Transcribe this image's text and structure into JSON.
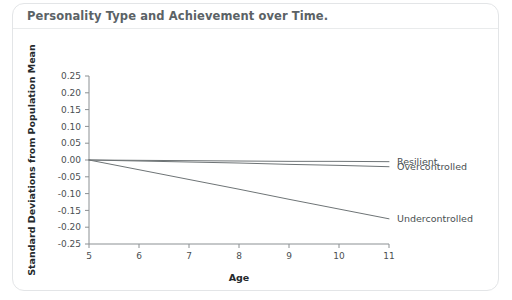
{
  "card": {
    "title": "Personality Type and Achievement over Time."
  },
  "chart_data": {
    "type": "line",
    "title": "Personality Type and Achievement over Time.",
    "xlabel": "Age",
    "ylabel": "Standard Deviations from Population Mean",
    "x": [
      5,
      6,
      7,
      8,
      9,
      10,
      11
    ],
    "xlim": [
      5,
      11
    ],
    "ylim": [
      -0.25,
      0.25
    ],
    "xticks": [
      "5",
      "6",
      "7",
      "8",
      "9",
      "10",
      "11"
    ],
    "yticks": [
      "0.25",
      "0.20",
      "0.15",
      "0.10",
      "0.05",
      "0.00",
      "-0.05",
      "-0.10",
      "-0.15",
      "-0.20",
      "-0.25"
    ],
    "ytick_values": [
      0.25,
      0.2,
      0.15,
      0.1,
      0.05,
      0,
      -0.05,
      -0.1,
      -0.15,
      -0.2,
      -0.25
    ],
    "grid": false,
    "legend_position": "right-inline",
    "line_color": "#6e7476",
    "series": [
      {
        "name": "Resilient",
        "values": [
          0.0,
          -0.001,
          -0.002,
          -0.003,
          -0.004,
          -0.004,
          -0.005
        ],
        "end_value": -0.005
      },
      {
        "name": "Overcontrolled",
        "values": [
          0.0,
          -0.003,
          -0.006,
          -0.009,
          -0.013,
          -0.016,
          -0.02
        ],
        "end_value": -0.02
      },
      {
        "name": "Undercontrolled",
        "values": [
          0.0,
          -0.029,
          -0.058,
          -0.087,
          -0.117,
          -0.146,
          -0.175
        ],
        "end_value": -0.175
      }
    ]
  }
}
